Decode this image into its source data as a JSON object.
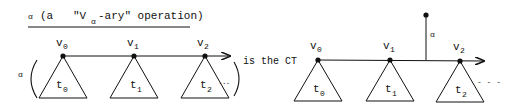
{
  "title": {
    "symbol": "α",
    "open": "(a",
    "quote_text": "\"V",
    "sub": "α",
    "rest": "-ary\" operation)"
  },
  "left_diagram": {
    "operator_label": "α",
    "nodes": [
      {
        "label": "v",
        "sub": "0",
        "tree": "t",
        "tree_sub": "0"
      },
      {
        "label": "v",
        "sub": "1",
        "tree": "t",
        "tree_sub": "1"
      },
      {
        "label": "v",
        "sub": "2",
        "tree": "t",
        "tree_sub": "2"
      }
    ],
    "continuation": "...",
    "suffix": "is the CT"
  },
  "right_diagram": {
    "operator_label": "α",
    "nodes": [
      {
        "label": "v",
        "sub": "0",
        "tree": "t",
        "tree_sub": "0"
      },
      {
        "label": "v",
        "sub": "1",
        "tree": "t",
        "tree_sub": "1"
      },
      {
        "label": "v",
        "sub": "2",
        "tree": "t",
        "tree_sub": "2"
      }
    ],
    "continuation": "- - -"
  },
  "colors": {
    "ink": "#111111",
    "background": "#ffffff"
  }
}
